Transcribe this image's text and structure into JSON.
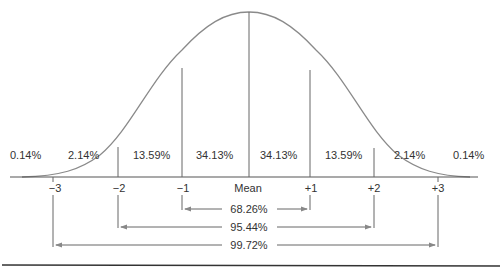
{
  "diagram": {
    "center_label": "Mean",
    "axis_ticks": [
      "−3",
      "−2",
      "−1",
      "Mean",
      "+1",
      "+2",
      "+3"
    ],
    "region_percentages": [
      "0.14%",
      "2.14%",
      "13.59%",
      "34.13%",
      "34.13%",
      "13.59%",
      "2.14%",
      "0.14%"
    ],
    "ranges": [
      {
        "span": "±1",
        "label": "68.26%"
      },
      {
        "span": "±2",
        "label": "95.44%"
      },
      {
        "span": "±3",
        "label": "99.72%"
      }
    ],
    "colors": {
      "line": "#777777",
      "text": "#333333"
    }
  }
}
